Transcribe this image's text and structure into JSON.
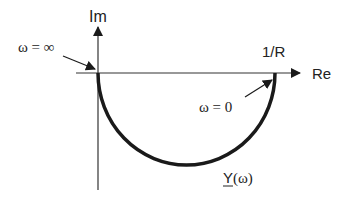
{
  "diagram": {
    "type": "admittance-locus",
    "axes": {
      "imag_label": "Im",
      "real_label": "Re"
    },
    "point_labels": {
      "intercept": "1/R",
      "omega_inf": "ω = ∞",
      "omega_zero": "ω = 0"
    },
    "curve_label_main": "Y",
    "curve_label_arg": "(ω)",
    "colors": {
      "ink": "#1a1a1a",
      "axis": "#333333"
    }
  }
}
